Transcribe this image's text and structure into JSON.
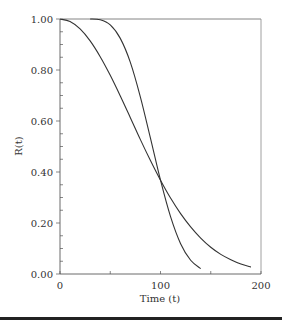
{
  "chart_data": {
    "type": "line",
    "title": "",
    "xlabel": "Time (t)",
    "ylabel": "R(t)",
    "xlim": [
      0,
      200
    ],
    "ylim": [
      0.0,
      1.0
    ],
    "xticks": [
      0,
      100,
      200
    ],
    "xtick_labels": [
      "0",
      "100",
      "200"
    ],
    "yticks": [
      0.0,
      0.2,
      0.4,
      0.6,
      0.8,
      1.0
    ],
    "ytick_labels": [
      "0.00",
      "0.20",
      "0.40",
      "0.60",
      "0.80",
      "1.00"
    ],
    "grid": false,
    "legend": null,
    "series": [
      {
        "name": "curve-1",
        "x": [
          0,
          10,
          20,
          30,
          40,
          50,
          60,
          70,
          80,
          90,
          100,
          110,
          120,
          130,
          140,
          150,
          160,
          170,
          180,
          190
        ],
        "values": [
          1.0,
          0.99,
          0.961,
          0.914,
          0.852,
          0.779,
          0.698,
          0.613,
          0.527,
          0.445,
          0.368,
          0.298,
          0.237,
          0.185,
          0.141,
          0.105,
          0.077,
          0.056,
          0.039,
          0.027
        ]
      },
      {
        "name": "curve-2",
        "x": [
          30,
          40,
          50,
          60,
          70,
          80,
          90,
          100,
          110,
          120,
          130,
          140
        ],
        "values": [
          1.0,
          0.997,
          0.977,
          0.924,
          0.83,
          0.694,
          0.533,
          0.368,
          0.225,
          0.119,
          0.054,
          0.021
        ]
      }
    ]
  },
  "annotations": {
    "bottom_rule": true
  }
}
